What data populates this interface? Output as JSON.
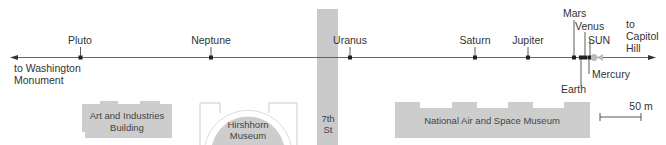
{
  "map": {
    "colors": {
      "building": "#cdcdcd",
      "street": "#c9c9c9",
      "line": "#555555",
      "text": "#333333",
      "sun": "#bbbbbb"
    },
    "directions": {
      "west": [
        "to Washington",
        "Monument"
      ],
      "east": [
        "to",
        "Capitol",
        "Hill"
      ]
    },
    "planets": [
      {
        "name": "Pluto",
        "x": 80
      },
      {
        "name": "Neptune",
        "x": 211
      },
      {
        "name": "Uranus",
        "x": 350
      },
      {
        "name": "Saturn",
        "x": 475
      },
      {
        "name": "Jupiter",
        "x": 528
      },
      {
        "name": "Mars",
        "x": 574
      },
      {
        "name": "Earth",
        "x": 581
      },
      {
        "name": "Venus",
        "x": 585
      },
      {
        "name": "Mercury",
        "x": 589
      },
      {
        "name": "SUN",
        "x": 594
      }
    ],
    "street": {
      "line1": "7th",
      "line2": "St"
    },
    "buildings": {
      "art_industries": [
        "Art and Industries",
        "Building"
      ],
      "hirshhorn": [
        "Hirshhorn",
        "Museum"
      ],
      "air_space": "National Air and Space Museum"
    },
    "scale": {
      "label": "50 m"
    }
  }
}
